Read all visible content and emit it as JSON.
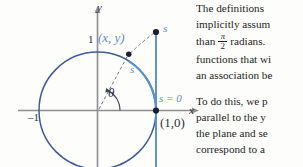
{
  "figure": {
    "axis_labels": {
      "y": "y",
      "x": "x"
    },
    "ticks": {
      "y_one": "1",
      "x_neg_one": "–1"
    },
    "point_on_circle_label": "(x, y)",
    "arc_length_label": "s",
    "tangent_top_label": "s",
    "origin_arc_label": "s = 0",
    "base_point_label": "(1,0)",
    "angle_label": "θ",
    "colors": {
      "circle": "#3f5c96",
      "accent_blue": "#5a8ec9",
      "axis": "#8a8a8a",
      "dashed": "#6a6f85",
      "dot": "#1a1f33"
    }
  },
  "text": {
    "paragraph1": [
      "The  definitions",
      "implicitly assum",
      "FRACTION_LINE",
      "functions that wi",
      "an association be"
    ],
    "fraction_line": {
      "before": "than",
      "numerator": "π",
      "denominator": "2",
      "after": "radians."
    },
    "paragraph2": [
      "To do this, we p",
      "parallel  to  the  y",
      "the  plane  and  se",
      "correspond to a"
    ]
  }
}
